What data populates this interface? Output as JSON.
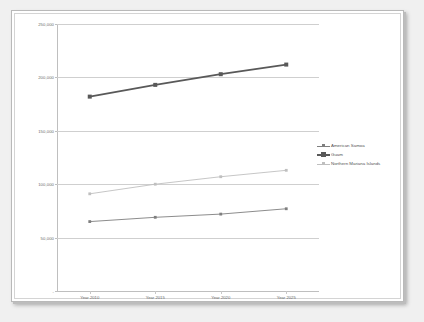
{
  "chart_data": {
    "type": "line",
    "title": "",
    "subtitle": "",
    "xlabel": "",
    "ylabel": "",
    "categories": [
      "Year 2010",
      "Year 2015",
      "Year 2020",
      "Year 2025"
    ],
    "ylim": [
      0,
      250000
    ],
    "y_ticks": [
      "-",
      "50,000",
      "100,000",
      "150,000",
      "200,000",
      "250,000"
    ],
    "y_tick_values": [
      0,
      50000,
      100000,
      150000,
      200000,
      250000
    ],
    "grid": true,
    "legend_position": "right",
    "series": [
      {
        "name": "American Samoa",
        "values": [
          65000,
          69000,
          72000,
          77000
        ],
        "color": "#7f7f7f",
        "marker": "square",
        "line_width": 0.9
      },
      {
        "name": "Guam",
        "values": [
          182000,
          193000,
          203000,
          212000
        ],
        "color": "#595959",
        "marker": "square",
        "line_width": 1.7
      },
      {
        "name": "Northern Mariana Islands",
        "values": [
          91000,
          100000,
          107000,
          113000
        ],
        "color": "#bfbfbf",
        "marker": "square",
        "line_width": 0.9
      }
    ]
  },
  "legend": {
    "items": [
      {
        "label": "American Samoa"
      },
      {
        "label": "Guam"
      },
      {
        "label": "Northern Mariana Islands"
      }
    ]
  },
  "axes": {
    "y_labels": [
      "250,000",
      "200,000",
      "150,000",
      "100,000",
      "50,000",
      "-"
    ],
    "x_labels": [
      "Year 2010",
      "Year 2015",
      "Year 2020",
      "Year 2025"
    ]
  },
  "colors": {
    "grid": "#cfcfcf",
    "axis": "#bfbfbf",
    "tick_text": "#6b6b6b",
    "legend_text": "#555555",
    "plot_background": "#ffffff",
    "page_background": "#f0f0f0",
    "series_american_samoa": "#7f7f7f",
    "series_guam": "#595959",
    "series_northern_mariana_islands": "#bfbfbf"
  }
}
